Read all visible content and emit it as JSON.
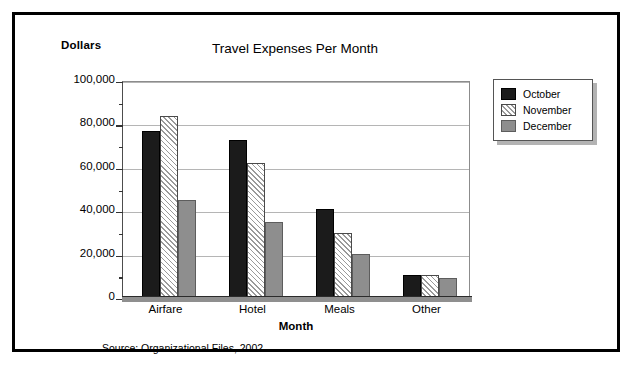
{
  "figure": {
    "ylabel_top": "Dollars",
    "source_note": "Source: Organizational Files, 2002"
  },
  "legend": {
    "position": "top-right",
    "items": [
      {
        "label": "October",
        "swatch": "black-solid"
      },
      {
        "label": "November",
        "swatch": "white-diagonal-hatch"
      },
      {
        "label": "December",
        "swatch": "gray-solid"
      }
    ]
  },
  "chart_data": {
    "type": "bar",
    "title": "Travel Expenses Per Month",
    "xlabel": "Month",
    "ylabel": "Dollars",
    "categories": [
      "Airfare",
      "Hotel",
      "Meals",
      "Other"
    ],
    "series": [
      {
        "name": "October",
        "values": [
          77000,
          73000,
          41000,
          10500
        ]
      },
      {
        "name": "November",
        "values": [
          84000,
          62000,
          30000,
          10500
        ]
      },
      {
        "name": "December",
        "values": [
          45000,
          35000,
          20500,
          9000
        ]
      }
    ],
    "ylim": [
      0,
      100000
    ],
    "ytick_values": [
      0,
      20000,
      40000,
      60000,
      80000,
      100000
    ],
    "ytick_labels": [
      "0",
      "20,000",
      "40,000",
      "60,000",
      "80,000",
      "100,000"
    ],
    "yminor_step": 10000,
    "grid": "horizontal",
    "legend_position": "right"
  }
}
